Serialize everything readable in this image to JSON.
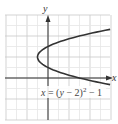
{
  "chart_data": {
    "type": "line",
    "title": "",
    "equation_label": "x = (y − 2)² − 1",
    "xlabel": "x",
    "ylabel": "y",
    "xlim": [
      -4,
      6
    ],
    "ylim": [
      -4,
      6
    ],
    "grid": true,
    "grid_step": 1,
    "series": [
      {
        "name": "x = (y − 2)² − 1",
        "points": [
          {
            "x": 5.9,
            "y": 4.63
          },
          {
            "x": 3,
            "y": 4
          },
          {
            "x": 1.25,
            "y": 3.5
          },
          {
            "x": 0,
            "y": 3
          },
          {
            "x": -0.75,
            "y": 2.5
          },
          {
            "x": -1,
            "y": 2
          },
          {
            "x": -0.75,
            "y": 1.5
          },
          {
            "x": 0,
            "y": 1
          },
          {
            "x": 1.25,
            "y": 0.5
          },
          {
            "x": 3,
            "y": 0
          },
          {
            "x": 5.9,
            "y": -0.63
          }
        ]
      }
    ],
    "vertex": {
      "x": -1,
      "y": 2
    },
    "colors": {
      "curve": "#333333",
      "axis": "#333333",
      "grid_major": "#c8c8c8",
      "grid_minor": "#e6e6e6"
    }
  }
}
